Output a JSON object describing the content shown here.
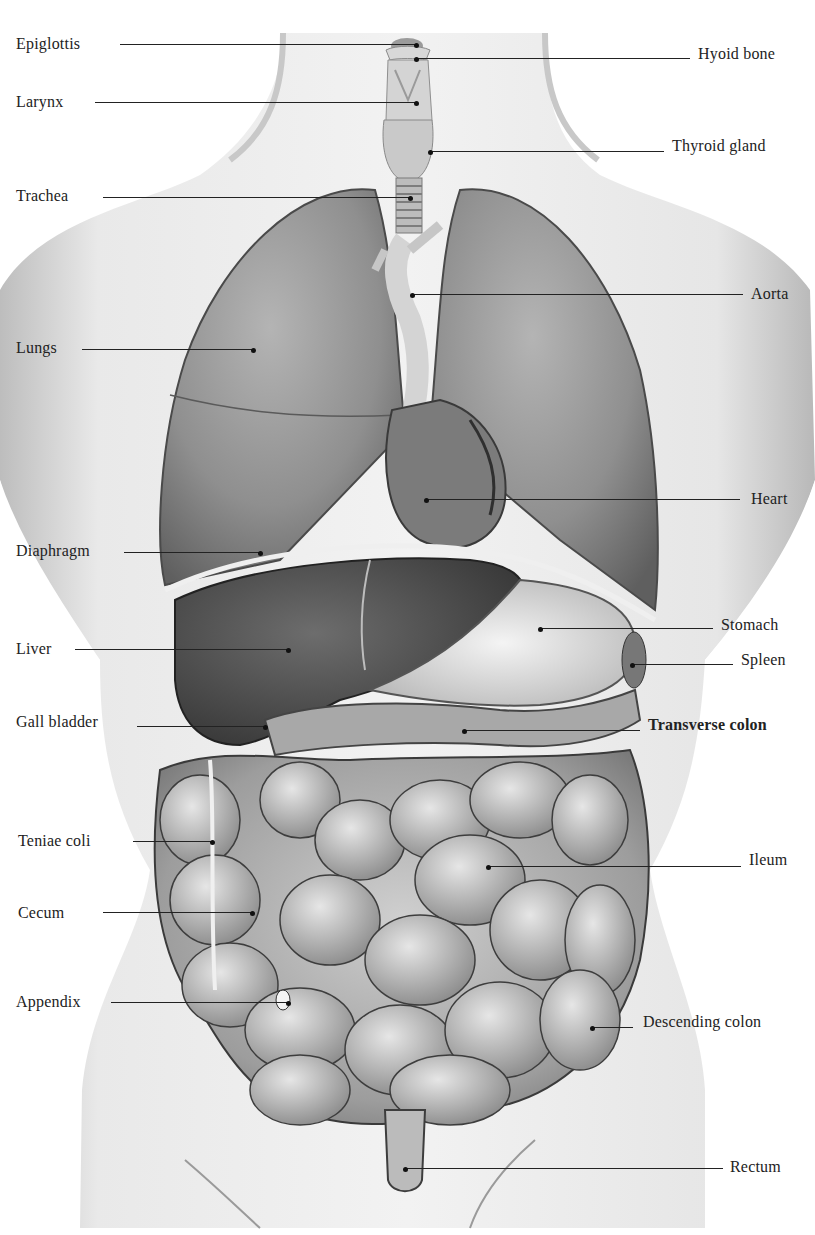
{
  "figure": {
    "colors": {
      "skin": "#e6e6e6",
      "skin_shadow": "#bdbdbd",
      "organ_dark": "#555555",
      "organ_mid": "#8a8a8a",
      "organ_light": "#c9c9c9",
      "line": "#222222",
      "background": "#ffffff"
    }
  },
  "labels": {
    "left": [
      {
        "id": "epiglottis",
        "text": "Epiglottis",
        "x": 16,
        "y": 35,
        "line_x1": 120,
        "line_x2": 416,
        "line_y": 44
      },
      {
        "id": "larynx",
        "text": "Larynx",
        "x": 16,
        "y": 93,
        "line_x1": 95,
        "line_x2": 416,
        "line_y": 102
      },
      {
        "id": "trachea",
        "text": "Trachea",
        "x": 16,
        "y": 187,
        "line_x1": 103,
        "line_x2": 410,
        "line_y": 197
      },
      {
        "id": "lungs",
        "text": "Lungs",
        "x": 16,
        "y": 339,
        "line_x1": 82,
        "line_x2": 253,
        "line_y": 349
      },
      {
        "id": "diaphragm",
        "text": "Diaphragm",
        "x": 16,
        "y": 542,
        "line_x1": 124,
        "line_x2": 260,
        "line_y": 552
      },
      {
        "id": "liver",
        "text": "Liver",
        "x": 16,
        "y": 640,
        "line_x1": 75,
        "line_x2": 288,
        "line_y": 649
      },
      {
        "id": "gall-bladder",
        "text": "Gall bladder",
        "x": 16,
        "y": 713,
        "line_x1": 137,
        "line_x2": 265,
        "line_y": 726
      },
      {
        "id": "teniae-coli",
        "text": "Teniae coli",
        "x": 18,
        "y": 832,
        "line_x1": 133,
        "line_x2": 212,
        "line_y": 841
      },
      {
        "id": "cecum",
        "text": "Cecum",
        "x": 18,
        "y": 904,
        "line_x1": 103,
        "line_x2": 252,
        "line_y": 912
      },
      {
        "id": "appendix",
        "text": "Appendix",
        "x": 16,
        "y": 993,
        "line_x1": 111,
        "line_x2": 288,
        "line_y": 1002
      }
    ],
    "right": [
      {
        "id": "hyoid-bone",
        "text": "Hyoid bone",
        "x": 698,
        "y": 45,
        "line_x1": 416,
        "line_x2": 690,
        "line_y": 58
      },
      {
        "id": "thyroid-gland",
        "text": "Thyroid gland",
        "x": 672,
        "y": 137,
        "line_x1": 430,
        "line_x2": 664,
        "line_y": 151
      },
      {
        "id": "aorta",
        "text": "Aorta",
        "x": 751,
        "y": 285,
        "line_x1": 412,
        "line_x2": 743,
        "line_y": 294
      },
      {
        "id": "heart",
        "text": "Heart",
        "x": 751,
        "y": 490,
        "line_x1": 426,
        "line_x2": 740,
        "line_y": 499
      },
      {
        "id": "stomach",
        "text": "Stomach",
        "x": 721,
        "y": 616,
        "line_x1": 540,
        "line_x2": 713,
        "line_y": 628
      },
      {
        "id": "spleen",
        "text": "Spleen",
        "x": 741,
        "y": 651,
        "line_x1": 632,
        "line_x2": 733,
        "line_y": 664
      },
      {
        "id": "transverse-colon",
        "text": "Transverse colon",
        "x": 648,
        "y": 716,
        "line_x1": 464,
        "line_x2": 640,
        "line_y": 730,
        "bold": true
      },
      {
        "id": "ileum",
        "text": "Ileum",
        "x": 749,
        "y": 851,
        "line_x1": 488,
        "line_x2": 741,
        "line_y": 866
      },
      {
        "id": "descending-colon",
        "text": "Descending colon",
        "x": 643,
        "y": 1013,
        "line_x1": 592,
        "line_x2": 633,
        "line_y": 1027
      },
      {
        "id": "rectum",
        "text": "Rectum",
        "x": 730,
        "y": 1158,
        "line_x1": 405,
        "line_x2": 723,
        "line_y": 1168
      }
    ]
  }
}
